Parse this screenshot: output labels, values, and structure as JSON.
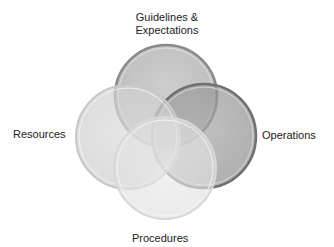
{
  "diagram": {
    "type": "venn",
    "circles": [
      {
        "id": "guidelines",
        "label": "Guidelines & Expectations",
        "cx": 166,
        "cy": 96,
        "r": 51,
        "fill": "#9a9a9a",
        "stroke": "#7a7a7a",
        "opacity": 0.55
      },
      {
        "id": "operations",
        "label": "Operations",
        "cx": 204,
        "cy": 136,
        "r": 52,
        "fill": "#8c8c8c",
        "stroke": "#6e6e6e",
        "opacity": 0.6
      },
      {
        "id": "resources",
        "label": "Resources",
        "cx": 128,
        "cy": 137,
        "r": 52,
        "fill": "#d2d2d2",
        "stroke": "#c4c4c4",
        "opacity": 0.55
      },
      {
        "id": "procedures",
        "label": "Procedures",
        "cx": 165,
        "cy": 168,
        "r": 51,
        "fill": "#e2e2e2",
        "stroke": "#d6d6d6",
        "opacity": 0.6
      }
    ],
    "labels": {
      "top": "Guidelines & Expectations",
      "right": "Operations",
      "left": "Resources",
      "bottom": "Procedures"
    }
  }
}
